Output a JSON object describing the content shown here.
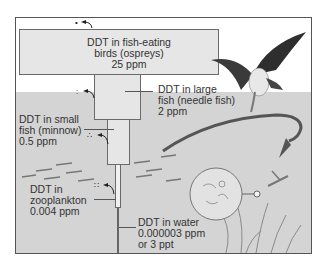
{
  "diagram": {
    "levels": [
      {
        "id": "ospreys",
        "line1": "DDT in fish-eating",
        "line2": "birds (ospreys)",
        "line3": "25 ppm"
      },
      {
        "id": "needle_fish",
        "line1": "DDT in large",
        "line2": "fish (needle fish)",
        "line3": "2 ppm"
      },
      {
        "id": "minnow",
        "line1": "DDT in small",
        "line2": "fish (minnow)",
        "line3": "0.5 ppm"
      },
      {
        "id": "zooplankton",
        "line1": "DDT in",
        "line2": "zooplankton",
        "line3": "0.004 ppm"
      },
      {
        "id": "water",
        "line1": "DDT in water",
        "line2": "0.000003 ppm",
        "line3": "or 3 ppt"
      }
    ],
    "icons": {
      "osprey": "osprey-illustration",
      "needle_fish": "needle-fish-illustration",
      "minnows": "minnow-school-illustration",
      "plankton": "plankton-magnified-circle",
      "seaweed": "aquatic-plant-illustration",
      "ddt_dots": "ddt-particle-dots"
    },
    "colors": {
      "water": "#d4d4d4",
      "box_fill": "#e6e6e6",
      "border": "#555555",
      "text": "#333333"
    }
  }
}
